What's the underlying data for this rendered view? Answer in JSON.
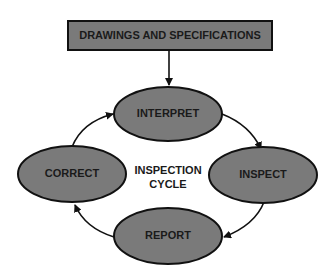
{
  "diagram": {
    "type": "cycle",
    "source": {
      "label": "DRAWINGS AND SPECIFICATIONS"
    },
    "center_label": [
      "INSPECTION",
      "CYCLE"
    ],
    "nodes": [
      {
        "id": "interpret",
        "label": "INTERPRET"
      },
      {
        "id": "inspect",
        "label": "INSPECT"
      },
      {
        "id": "report",
        "label": "REPORT"
      },
      {
        "id": "correct",
        "label": "CORRECT"
      }
    ],
    "edges": [
      {
        "from": "source",
        "to": "interpret"
      },
      {
        "from": "interpret",
        "to": "inspect"
      },
      {
        "from": "inspect",
        "to": "report"
      },
      {
        "from": "report",
        "to": "correct"
      },
      {
        "from": "correct",
        "to": "interpret"
      }
    ],
    "colors": {
      "fill": "#7a7a7a",
      "stroke": "#111111",
      "background": "#ffffff"
    }
  }
}
